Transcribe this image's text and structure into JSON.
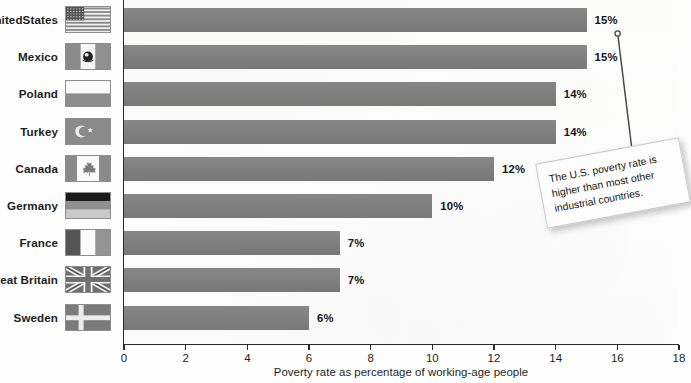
{
  "chart_data": {
    "type": "bar",
    "orientation": "horizontal",
    "title": "",
    "xlabel": "Poverty rate as percentage of working-age people",
    "ylabel": "",
    "xlim": [
      0,
      18
    ],
    "xticks": [
      0,
      2,
      4,
      6,
      8,
      10,
      12,
      14,
      16,
      18
    ],
    "grid": false,
    "legend": false,
    "bar_color": "#7e7e7e",
    "categories": [
      "United States",
      "Mexico",
      "Poland",
      "Turkey",
      "Canada",
      "Germany",
      "France",
      "Great Britain",
      "Sweden"
    ],
    "values": [
      15,
      15,
      14,
      14,
      12,
      10,
      7,
      7,
      6
    ],
    "value_labels": [
      "15%",
      "15%",
      "14%",
      "14%",
      "12%",
      "10%",
      "7%",
      "7%",
      "6%"
    ],
    "annotations": [
      {
        "text": "The U.S. poverty rate is higher than most other industrial countries.",
        "points_to": "United States"
      }
    ]
  },
  "axis": {
    "x_title": "Poverty rate as percentage of working-age people",
    "tick_labels": [
      "0",
      "2",
      "4",
      "6",
      "8",
      "10",
      "12",
      "14",
      "16",
      "18"
    ]
  },
  "rows": [
    {
      "country": "United States",
      "label_line1": "United",
      "label_line2": "States",
      "value": 15,
      "value_label": "15%",
      "flag": "flag-united-states"
    },
    {
      "country": "Mexico",
      "label_line1": "Mexico",
      "label_line2": "",
      "value": 15,
      "value_label": "15%",
      "flag": "flag-mexico"
    },
    {
      "country": "Poland",
      "label_line1": "Poland",
      "label_line2": "",
      "value": 14,
      "value_label": "14%",
      "flag": "flag-poland"
    },
    {
      "country": "Turkey",
      "label_line1": "Turkey",
      "label_line2": "",
      "value": 14,
      "value_label": "14%",
      "flag": "flag-turkey"
    },
    {
      "country": "Canada",
      "label_line1": "Canada",
      "label_line2": "",
      "value": 12,
      "value_label": "12%",
      "flag": "flag-canada"
    },
    {
      "country": "Germany",
      "label_line1": "Germany",
      "label_line2": "",
      "value": 10,
      "value_label": "10%",
      "flag": "flag-germany"
    },
    {
      "country": "France",
      "label_line1": "France",
      "label_line2": "",
      "value": 7,
      "value_label": "7%",
      "flag": "flag-france"
    },
    {
      "country": "Great Britain",
      "label_line1": "Great Britain",
      "label_line2": "",
      "value": 7,
      "value_label": "7%",
      "flag": "flag-great-britain"
    },
    {
      "country": "Sweden",
      "label_line1": "Sweden",
      "label_line2": "",
      "value": 6,
      "value_label": "6%",
      "flag": "flag-sweden"
    }
  ],
  "callout": {
    "text": "The U.S. poverty rate is higher than most other industrial countries."
  },
  "colors": {
    "bar": "#7e7e7e",
    "axis": "#2a2a2a",
    "text": "#1d1d1d",
    "plot_background": "#fbfbfa",
    "callout_background": "#fdfdfd",
    "callout_border": "#c9c9c9"
  }
}
